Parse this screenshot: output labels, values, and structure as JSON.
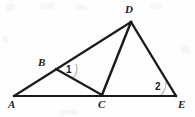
{
  "figure": {
    "background_color": "#fefefe",
    "stroke_color": "#1a1a1a",
    "arc_color": "#bfbfbf",
    "width": 195,
    "height": 117,
    "points": [
      {
        "name": "A",
        "label": "A",
        "x": 14,
        "y": 96,
        "label_x": 8,
        "label_y": 99
      },
      {
        "name": "B",
        "label": "B",
        "x": 56,
        "y": 69,
        "label_x": 38,
        "label_y": 57
      },
      {
        "name": "C",
        "label": "C",
        "x": 102,
        "y": 95,
        "label_x": 98,
        "label_y": 99
      },
      {
        "name": "D",
        "label": "D",
        "x": 131,
        "y": 22,
        "label_x": 125,
        "label_y": 4
      },
      {
        "name": "E",
        "label": "E",
        "x": 176,
        "y": 96,
        "label_x": 178,
        "label_y": 99
      }
    ],
    "segments": [
      {
        "name": "segment-AD",
        "from": "A",
        "to": "D",
        "x1": 14,
        "y1": 96,
        "x2": 131,
        "y2": 22
      },
      {
        "name": "segment-AE",
        "from": "A",
        "to": "E",
        "x1": 14,
        "y1": 96,
        "x2": 176,
        "y2": 96
      },
      {
        "name": "segment-BC",
        "from": "B",
        "to": "C",
        "x1": 56,
        "y1": 69,
        "x2": 102,
        "y2": 95
      },
      {
        "name": "segment-DC",
        "from": "D",
        "to": "C",
        "x1": 131,
        "y1": 22,
        "x2": 102,
        "y2": 95
      },
      {
        "name": "segment-DE",
        "from": "D",
        "to": "E",
        "x1": 131,
        "y1": 22,
        "x2": 176,
        "y2": 96
      }
    ],
    "angles": [
      {
        "name": "angle-1",
        "label": "1",
        "vertex": "B",
        "label_x": 66,
        "label_y": 65,
        "arc_path": "M 76 64 A 13 13 0 0 1 73 78"
      },
      {
        "name": "angle-2",
        "label": "2",
        "vertex": "E",
        "label_x": 155,
        "label_y": 82,
        "arc_path": "M 160 96 A 17 17 0 0 0 166 82"
      }
    ]
  }
}
